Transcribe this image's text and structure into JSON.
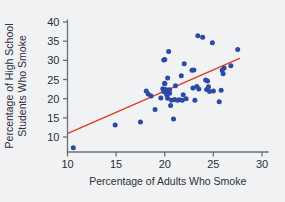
{
  "chart_data": {
    "type": "scatter",
    "title": "",
    "xlabel": "Percentage of Adults Who Smoke",
    "ylabel": "Percentage of High School Students Who Smoke",
    "ylabel_lines": [
      "Percentage of High School",
      "Students Who Smoke"
    ],
    "xlim": [
      10,
      30
    ],
    "ylim": [
      6,
      41
    ],
    "xticks": [
      10,
      15,
      20,
      25,
      30
    ],
    "yticks": [
      10,
      15,
      20,
      25,
      30,
      35,
      40
    ],
    "xtick_labels": [
      "10",
      "15",
      "20",
      "25",
      "30"
    ],
    "ytick_labels": [
      "10",
      "15",
      "20",
      "25",
      "30",
      "35",
      "40"
    ],
    "grid": false,
    "legend": null,
    "point_color": "#2c49a6",
    "line_color": "#e23b22",
    "background_color": "#f1f2f4",
    "axis_color": "#6b6f76",
    "trend_line": {
      "type": "linear-fit",
      "x_start": 10.1,
      "y_start": 11.0,
      "x_end": 27.7,
      "y_end": 30.5
    },
    "points": [
      [
        10.6,
        7.2
      ],
      [
        14.9,
        13.1
      ],
      [
        17.5,
        13.9
      ],
      [
        18.1,
        22.0
      ],
      [
        18.3,
        21.2
      ],
      [
        18.6,
        20.7
      ],
      [
        19.0,
        17.2
      ],
      [
        19.6,
        20.2
      ],
      [
        19.8,
        22.6
      ],
      [
        19.9,
        30.1
      ],
      [
        19.9,
        21.9
      ],
      [
        20.0,
        30.2
      ],
      [
        20.0,
        24.0
      ],
      [
        20.0,
        23.9
      ],
      [
        20.1,
        22.4
      ],
      [
        20.1,
        21.7
      ],
      [
        20.2,
        22.1
      ],
      [
        20.2,
        21.0
      ],
      [
        20.3,
        25.4
      ],
      [
        20.3,
        20.1
      ],
      [
        20.4,
        32.3
      ],
      [
        20.5,
        22.3
      ],
      [
        20.5,
        21.4
      ],
      [
        20.6,
        18.2
      ],
      [
        20.7,
        19.6
      ],
      [
        20.9,
        14.7
      ],
      [
        21.0,
        19.8
      ],
      [
        21.1,
        23.4
      ],
      [
        21.3,
        19.6
      ],
      [
        21.5,
        19.7
      ],
      [
        21.7,
        26.0
      ],
      [
        21.8,
        19.6
      ],
      [
        21.9,
        21.0
      ],
      [
        22.0,
        29.1
      ],
      [
        22.2,
        20.0
      ],
      [
        22.8,
        27.4
      ],
      [
        22.9,
        22.8
      ],
      [
        23.0,
        27.5
      ],
      [
        23.1,
        19.6
      ],
      [
        23.3,
        23.2
      ],
      [
        23.4,
        36.4
      ],
      [
        23.5,
        22.5
      ],
      [
        23.9,
        36.0
      ],
      [
        24.2,
        24.9
      ],
      [
        24.3,
        22.4
      ],
      [
        24.4,
        24.6
      ],
      [
        24.5,
        23.1
      ],
      [
        24.6,
        21.9
      ],
      [
        24.9,
        34.6
      ],
      [
        25.0,
        22.0
      ],
      [
        25.6,
        19.2
      ],
      [
        25.8,
        22.2
      ],
      [
        25.9,
        27.4
      ],
      [
        26.0,
        26.5
      ],
      [
        26.1,
        28.0
      ],
      [
        26.8,
        28.6
      ],
      [
        27.5,
        32.8
      ]
    ]
  }
}
